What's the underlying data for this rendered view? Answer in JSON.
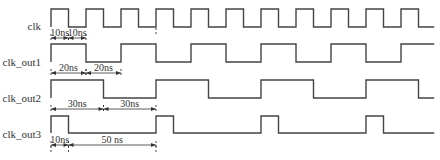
{
  "diagram": {
    "type": "timing-diagram",
    "time_unit": "ns",
    "time_end_ns": 219,
    "signals": [
      {
        "name": "clk",
        "label": "clk",
        "initial": 1,
        "pattern": "clock",
        "high_ns": 10,
        "low_ns": 10
      },
      {
        "name": "clk_out1",
        "label": "clk_out1",
        "initial": 1,
        "pattern": "clock",
        "high_ns": 20,
        "low_ns": 20
      },
      {
        "name": "clk_out2",
        "label": "clk_out2",
        "initial": 1,
        "pattern": "clock",
        "high_ns": 30,
        "low_ns": 30
      },
      {
        "name": "clk_out3",
        "label": "clk_out3",
        "initial": 1,
        "pattern": "clock",
        "high_ns": 10,
        "low_ns": 50
      }
    ],
    "annotations": [
      {
        "signal": 0,
        "text": "10ns",
        "from_ns": 0,
        "to_ns": 10
      },
      {
        "signal": 0,
        "text": "10ns",
        "from_ns": 10,
        "to_ns": 20
      },
      {
        "signal": 1,
        "text": "20ns",
        "from_ns": 0,
        "to_ns": 20
      },
      {
        "signal": 1,
        "text": "20ns",
        "from_ns": 20,
        "to_ns": 40
      },
      {
        "signal": 2,
        "text": "30ns",
        "from_ns": 0,
        "to_ns": 30
      },
      {
        "signal": 2,
        "text": "30ns",
        "from_ns": 30,
        "to_ns": 60
      },
      {
        "signal": 3,
        "text": "10ns",
        "from_ns": 0,
        "to_ns": 10
      },
      {
        "signal": 3,
        "text": "50 ns",
        "from_ns": 10,
        "to_ns": 60
      }
    ],
    "reference_lines_ns": [
      60
    ]
  }
}
